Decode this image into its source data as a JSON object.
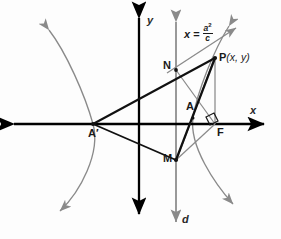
{
  "figure": {
    "title_alt": "Hyperbola focus-directrix construction",
    "colors": {
      "ink": "#1a1a1a",
      "axis": "#000000",
      "curve": "#8a8a8a",
      "directrix": "#8e8e8e",
      "guide": "#8a8a8a",
      "background": "#fdfdfd"
    },
    "axes": {
      "x_label": "x",
      "y_label": "y",
      "x_axis_y": 124,
      "y_axis_x": 139
    },
    "directrix": {
      "label": "d",
      "x": 176
    },
    "equation": {
      "lhs": "x",
      "relation": "=",
      "numerator": "a",
      "numerator_exponent": "2",
      "denominator": "c"
    },
    "points": [
      {
        "id": "A-prime",
        "label": "A′",
        "x": 93,
        "y": 124,
        "label_x": 88,
        "label_y": 130
      },
      {
        "id": "N",
        "label": "N",
        "x": 176,
        "y": 70,
        "label_x": 164,
        "label_y": 62
      },
      {
        "id": "P",
        "label": "P",
        "coords": "(x, y)",
        "x": 215,
        "y": 58,
        "label_x": 218,
        "label_y": 52
      },
      {
        "id": "A",
        "label": "A",
        "x": 193,
        "y": 118,
        "label_x": 186,
        "label_y": 104
      },
      {
        "id": "F",
        "label": "F",
        "x": 215,
        "y": 124,
        "label_x": 217,
        "label_y": 129
      },
      {
        "id": "M",
        "label": "M",
        "x": 176,
        "y": 160,
        "label_x": 164,
        "label_y": 155
      }
    ],
    "segments": [
      {
        "id": "A-prime-to-P",
        "from": "A-prime",
        "to": "P",
        "style": "heavy"
      },
      {
        "id": "N-to-M",
        "from": "N",
        "to": "M",
        "style": "heavy"
      },
      {
        "id": "M-to-P",
        "from": "M",
        "to": "P",
        "style": "heavy"
      },
      {
        "id": "N-to-F",
        "from": "N",
        "to": "F",
        "style": "light"
      },
      {
        "id": "M-to-F",
        "from": "M",
        "to": "F",
        "style": "light"
      },
      {
        "id": "P-to-F",
        "from": "P",
        "to": "F",
        "style": "light"
      },
      {
        "id": "N-to-P-ray",
        "from": "N",
        "to": "upper-right",
        "style": "light-arrow"
      }
    ],
    "right_angle_marker": {
      "at": "F",
      "size": 8
    },
    "curves": [
      {
        "id": "left-branch",
        "vertex": [
          93,
          124
        ],
        "opens": "left"
      },
      {
        "id": "right-branch",
        "vertex": [
          193,
          118
        ],
        "opens": "right"
      }
    ]
  }
}
